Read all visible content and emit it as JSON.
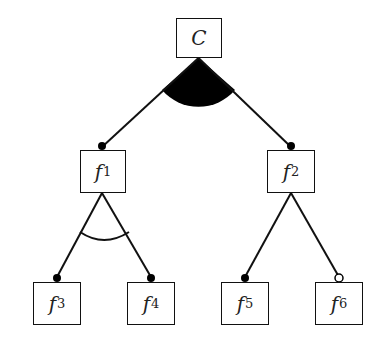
{
  "diagram": {
    "type": "feature-model",
    "root": {
      "label": "C",
      "group": "or"
    },
    "nodes": [
      {
        "id": "f1",
        "base": "f",
        "sub": "1",
        "parent": "C",
        "mandatory": true,
        "group": "alternative"
      },
      {
        "id": "f2",
        "base": "f",
        "sub": "2",
        "parent": "C",
        "mandatory": true,
        "group": "none"
      },
      {
        "id": "f3",
        "base": "f",
        "sub": "3",
        "parent": "f1",
        "mandatory": true
      },
      {
        "id": "f4",
        "base": "f",
        "sub": "4",
        "parent": "f1",
        "mandatory": true
      },
      {
        "id": "f5",
        "base": "f",
        "sub": "5",
        "parent": "f2",
        "mandatory": true
      },
      {
        "id": "f6",
        "base": "f",
        "sub": "6",
        "parent": "f2",
        "mandatory": false
      }
    ]
  }
}
